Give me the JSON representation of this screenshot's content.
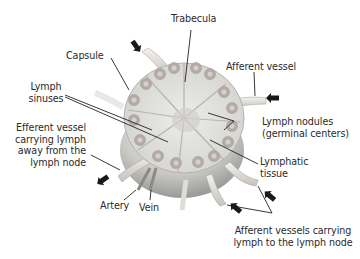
{
  "diagram": {
    "colors": {
      "background": "#ffffff",
      "label_text": "#2a2a2a",
      "leader_line": "#222222",
      "arrow": "#1a1a1a",
      "tissue_light": "#e6e6e2",
      "tissue_mid": "#c8c8c4",
      "tissue_dark": "#9a9a96",
      "nodule_fill": "#b5aca8",
      "nodule_core": "#d6cfcc"
    },
    "labels": {
      "trabecula": "Trabecula",
      "capsule": "Capsule",
      "afferent_vessel": "Afferent vessel",
      "lymph_sinuses_1": "Lymph",
      "lymph_sinuses_2": "sinuses",
      "lymph_nodules_1": "Lymph nodules",
      "lymph_nodules_2": "(germinal centers)",
      "efferent_1": "Efferent vessel",
      "efferent_2": "carrying lymph",
      "efferent_3": "away from the",
      "efferent_4": "lymph node",
      "lymphatic_tissue_1": "Lymphatic",
      "lymphatic_tissue_2": "tissue",
      "artery": "Artery",
      "vein": "Vein",
      "afferent_vessels_1": "Afferent vessels carrying",
      "afferent_vessels_2": "lymph to the lymph node"
    },
    "flow_arrows": [
      {
        "name": "afferent-top",
        "direction": "into node"
      },
      {
        "name": "afferent-right",
        "direction": "into node"
      },
      {
        "name": "efferent-left",
        "direction": "out of node"
      },
      {
        "name": "afferent-bottom-mid",
        "direction": "into node"
      },
      {
        "name": "afferent-bottom-right",
        "direction": "into node"
      }
    ]
  }
}
